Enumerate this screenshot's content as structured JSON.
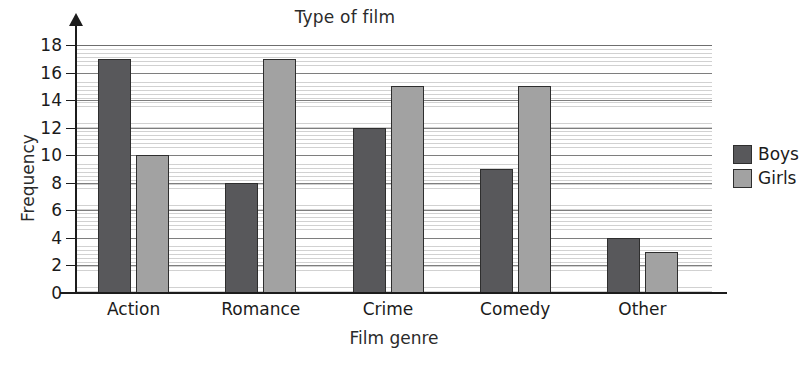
{
  "chart_data": {
    "type": "bar",
    "title": "Type of film",
    "xlabel": "Film genre",
    "ylabel": "Frequency",
    "categories": [
      "Action",
      "Romance",
      "Crime",
      "Comedy",
      "Other"
    ],
    "series": [
      {
        "name": "Boys",
        "color": "#58585b",
        "values": [
          17,
          8,
          12,
          9,
          4
        ]
      },
      {
        "name": "Girls",
        "color": "#a2a2a2",
        "values": [
          10,
          17,
          15,
          15,
          3
        ]
      }
    ],
    "ylim": [
      0,
      18
    ],
    "ytick_step": 2,
    "yticks": [
      0,
      2,
      4,
      6,
      8,
      10,
      12,
      14,
      16,
      18
    ],
    "ytick_labels": [
      "0",
      "2",
      "4",
      "6",
      "8",
      "10",
      "12",
      "14",
      "16",
      "18"
    ],
    "grid": true,
    "grid_style": "dense-horizontal-hatch",
    "legend_position": "right"
  }
}
